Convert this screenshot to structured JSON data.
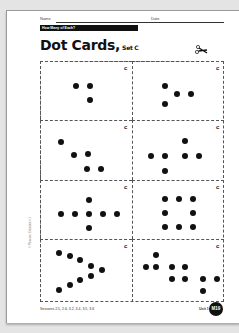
{
  "header": {
    "name_label": "Name",
    "date_label": "Date",
    "banner": "How Many of Each?"
  },
  "title": {
    "main": "Dot Cards,",
    "subtitle": "Set C"
  },
  "cut_marker": "scissors-icon",
  "cards": [
    {
      "count": 3,
      "corner_mark": "c",
      "dots": [
        [
          35,
          24
        ],
        [
          49,
          24
        ],
        [
          49,
          38
        ]
      ]
    },
    {
      "count": 4,
      "corner_mark": "c",
      "dots": [
        [
          32,
          24
        ],
        [
          44,
          32
        ],
        [
          58,
          32
        ],
        [
          32,
          42
        ]
      ]
    },
    {
      "count": 5,
      "corner_mark": "c",
      "dots": [
        [
          20,
          21
        ],
        [
          33,
          34
        ],
        [
          47,
          33
        ],
        [
          46,
          48
        ],
        [
          60,
          48
        ]
      ]
    },
    {
      "count": 6,
      "corner_mark": "c",
      "dots": [
        [
          18,
          35
        ],
        [
          32,
          35
        ],
        [
          52,
          20
        ],
        [
          52,
          35
        ],
        [
          66,
          35
        ],
        [
          32,
          50
        ]
      ]
    },
    {
      "count": 7,
      "corner_mark": "c",
      "dots": [
        [
          20,
          33
        ],
        [
          34,
          33
        ],
        [
          48,
          33
        ],
        [
          62,
          33
        ],
        [
          76,
          33
        ],
        [
          48,
          19
        ],
        [
          48,
          47
        ]
      ]
    },
    {
      "count": 8,
      "corner_mark": "c",
      "dots": [
        [
          32,
          18
        ],
        [
          46,
          18
        ],
        [
          60,
          18
        ],
        [
          32,
          32
        ],
        [
          60,
          32
        ],
        [
          32,
          46
        ],
        [
          46,
          46
        ],
        [
          60,
          46
        ]
      ]
    },
    {
      "count": 9,
      "corner_mark": "c",
      "dots": [
        [
          18,
          13
        ],
        [
          29,
          16
        ],
        [
          39,
          20
        ],
        [
          50,
          26
        ],
        [
          61,
          30
        ],
        [
          50,
          36
        ],
        [
          39,
          40
        ],
        [
          29,
          45
        ],
        [
          18,
          50
        ]
      ]
    },
    {
      "count": 10,
      "corner_mark": "c",
      "dots": [
        [
          23,
          15
        ],
        [
          13,
          27
        ],
        [
          23,
          27
        ],
        [
          39,
          27
        ],
        [
          52,
          27
        ],
        [
          39,
          39
        ],
        [
          52,
          39
        ],
        [
          70,
          39
        ],
        [
          84,
          39
        ],
        [
          70,
          51
        ]
      ]
    }
  ],
  "footer": {
    "sessions": "Sessions 2.5, 2.6, 3.2, 3.4, 3.5, 3.6",
    "unit": "Unit 1",
    "page_badge": "M19",
    "copyright": "© Pearson Education 1"
  }
}
